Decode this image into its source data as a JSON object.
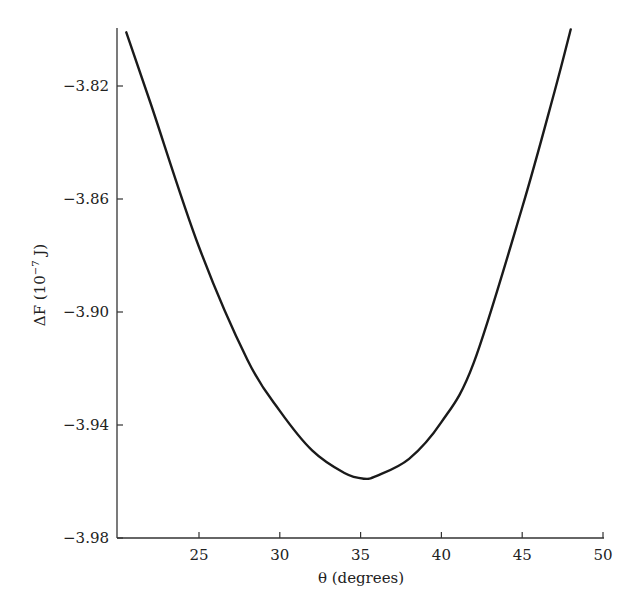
{
  "chart_data": {
    "type": "line",
    "title": "",
    "xlabel": "θ (degrees)",
    "ylabel": "ΔF (10⁻⁷ J)",
    "ylabel_parts": {
      "prefix": "ΔF (10",
      "sup": "−7",
      "suffix": " J)"
    },
    "xlim": [
      20,
      50
    ],
    "ylim": [
      -3.98,
      -3.8
    ],
    "x_ticks": [
      25,
      30,
      35,
      40,
      45,
      50
    ],
    "x_tick_labels": [
      "25",
      "30",
      "35",
      "40",
      "45",
      "50"
    ],
    "y_ticks": [
      -3.82,
      -3.86,
      -3.9,
      -3.94,
      -3.98
    ],
    "y_tick_labels": [
      "−3.82",
      "−3.86",
      "−3.90",
      "−3.94",
      "−3.98"
    ],
    "grid": false,
    "legend": null,
    "series": [
      {
        "name": "ΔF(θ)",
        "color": "#1a1a1a",
        "x": [
          20.5,
          22,
          25,
          28,
          30,
          32,
          34,
          35.2,
          36,
          38,
          40,
          42,
          45,
          47,
          48
        ],
        "values": [
          -3.801,
          -3.826,
          -3.877,
          -3.917,
          -3.935,
          -3.949,
          -3.957,
          -3.959,
          -3.958,
          -3.952,
          -3.939,
          -3.918,
          -3.863,
          -3.822,
          -3.8
        ]
      }
    ],
    "annotations": []
  }
}
